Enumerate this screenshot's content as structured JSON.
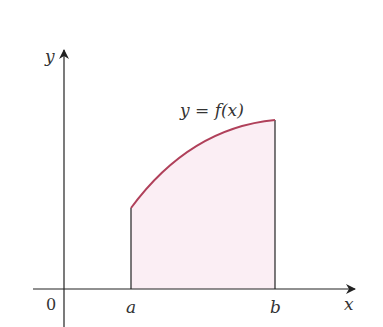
{
  "figure": {
    "y_axis_label": "y",
    "x_axis_label": "x",
    "origin_label": "0",
    "a_label": "a",
    "b_label": "b",
    "curve_label": "y = f(x)",
    "colors": {
      "curve": "#b0405a",
      "fill": "#fbeef4",
      "axis": "#222222"
    }
  }
}
